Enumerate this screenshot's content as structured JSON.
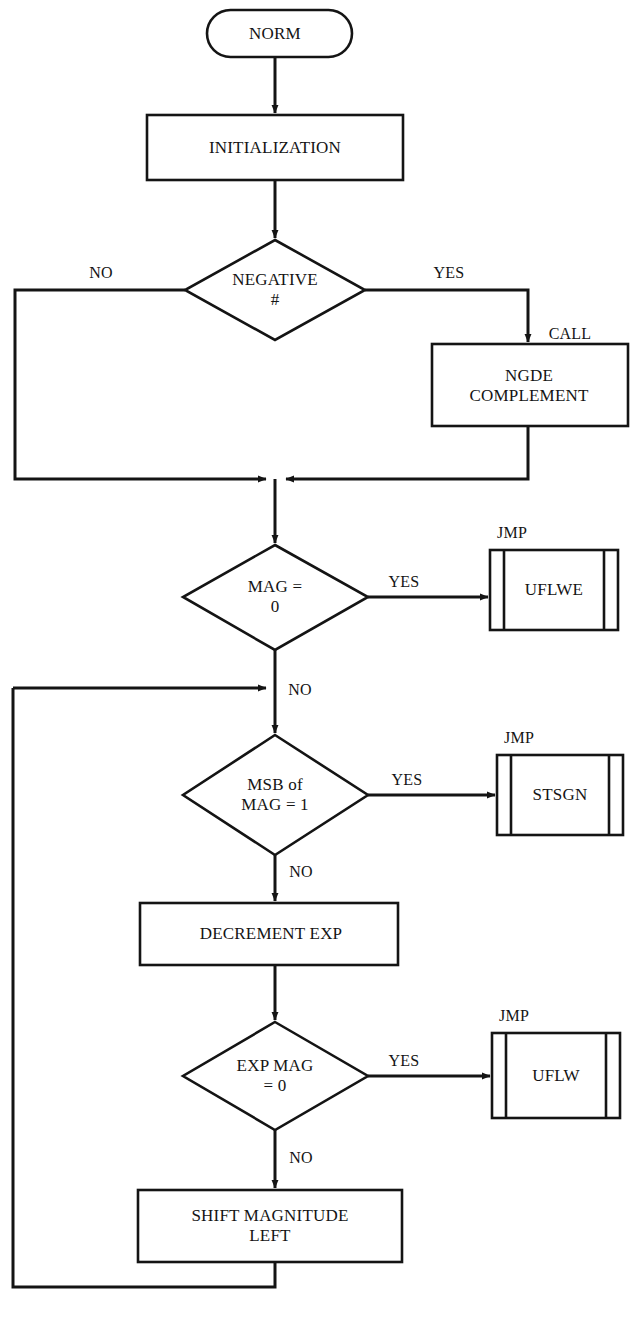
{
  "diagram": {
    "stroke_color": "#141414",
    "fill_color": "#ffffff",
    "nodes": [
      {
        "id": "start",
        "shape": "terminator",
        "label": "NORM"
      },
      {
        "id": "init",
        "shape": "process",
        "label": "INITIALIZATION"
      },
      {
        "id": "negative",
        "shape": "decision",
        "label": "NEGATIVE\n#"
      },
      {
        "id": "ngde",
        "shape": "process",
        "label": "NGDE\nCOMPLEMENT"
      },
      {
        "id": "mag0",
        "shape": "decision",
        "label": "MAG =\n0"
      },
      {
        "id": "uflwe",
        "shape": "predefined-process",
        "label": "UFLWE"
      },
      {
        "id": "msb",
        "shape": "decision",
        "label": "MSB of\nMAG = 1"
      },
      {
        "id": "stsgn",
        "shape": "predefined-process",
        "label": "STSGN"
      },
      {
        "id": "decrement",
        "shape": "process",
        "label": "DECREMENT EXP"
      },
      {
        "id": "expmag0",
        "shape": "decision",
        "label": "EXP MAG\n= 0"
      },
      {
        "id": "uflw",
        "shape": "predefined-process",
        "label": "UFLW"
      },
      {
        "id": "shift",
        "shape": "process",
        "label": "SHIFT MAGNITUDE\nLEFT"
      }
    ],
    "edge_labels": [
      {
        "id": "negative-no",
        "label": "NO",
        "from": "negative",
        "to": "merge"
      },
      {
        "id": "negative-yes",
        "label": "YES",
        "from": "negative",
        "to": "ngde"
      },
      {
        "id": "ngde-call",
        "label": "CALL",
        "from": "negative",
        "to": "ngde"
      },
      {
        "id": "mag0-yes",
        "label": "YES",
        "from": "mag0",
        "to": "uflwe"
      },
      {
        "id": "uflwe-jmp",
        "label": "JMP",
        "from": "mag0",
        "to": "uflwe"
      },
      {
        "id": "mag0-no",
        "label": "NO",
        "from": "mag0",
        "to": "msb"
      },
      {
        "id": "msb-yes",
        "label": "YES",
        "from": "msb",
        "to": "stsgn"
      },
      {
        "id": "stsgn-jmp",
        "label": "JMP",
        "from": "msb",
        "to": "stsgn"
      },
      {
        "id": "msb-no",
        "label": "NO",
        "from": "msb",
        "to": "decrement"
      },
      {
        "id": "expmag0-yes",
        "label": "YES",
        "from": "expmag0",
        "to": "uflw"
      },
      {
        "id": "uflw-jmp",
        "label": "JMP",
        "from": "expmag0",
        "to": "uflw"
      },
      {
        "id": "expmag0-no",
        "label": "NO",
        "from": "expmag0",
        "to": "shift"
      }
    ]
  }
}
